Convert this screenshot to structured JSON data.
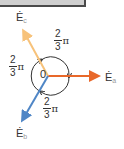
{
  "header": {
    "bar": ""
  },
  "diagram": {
    "origin_label": "0",
    "phasors": [
      {
        "id": "a",
        "symbol": "Ė",
        "subscript": "a",
        "color": "#e8682a",
        "angle_deg": 0
      },
      {
        "id": "b",
        "symbol": "Ė",
        "subscript": "b",
        "color": "#4f86c6",
        "angle_deg": -120
      },
      {
        "id": "c",
        "symbol": "Ė",
        "subscript": "c",
        "color": "#f7c27a",
        "angle_deg": 120
      }
    ],
    "angle_labels": [
      {
        "position": "top-right",
        "numerator": "2",
        "denominator": "3",
        "suffix": "π"
      },
      {
        "position": "left",
        "numerator": "2",
        "denominator": "3",
        "suffix": "π"
      },
      {
        "position": "bottom",
        "numerator": "2",
        "denominator": "3",
        "suffix": "π"
      }
    ]
  }
}
